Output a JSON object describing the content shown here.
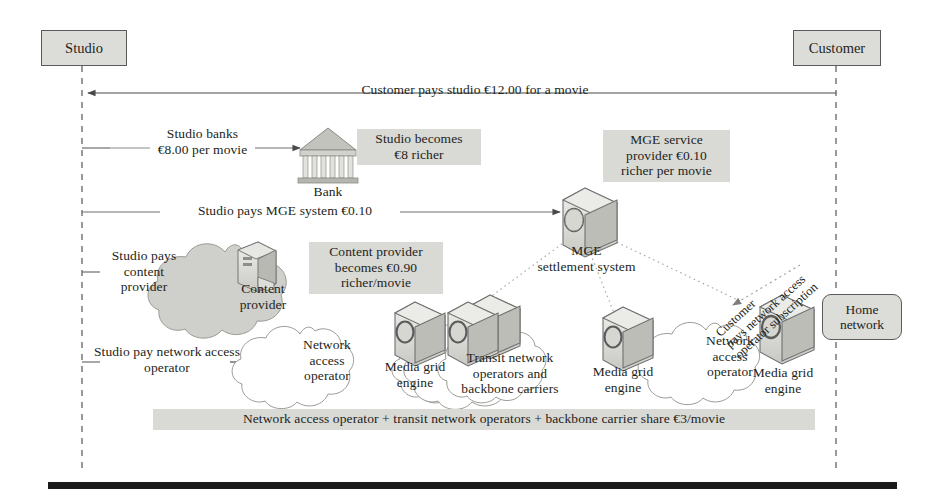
{
  "figure": {
    "type": "flow-diagram",
    "title_visible": false
  },
  "endpoints": {
    "studio": "Studio",
    "customer": "Customer",
    "home_network": "Home\nnetwork"
  },
  "flows": [
    {
      "id": "customer-pays-studio",
      "label": "Customer pays studio €12.00 for a movie",
      "direction": "customer-to-studio",
      "amount": "€12.00"
    },
    {
      "id": "studio-banks",
      "label": "Studio banks\n€8.00 per movie",
      "direction": "studio-to-bank",
      "amount": "€8.00"
    },
    {
      "id": "studio-pays-mge",
      "label": "Studio pays MGE system €0.10",
      "direction": "studio-to-mge",
      "amount": "€0.10"
    },
    {
      "id": "studio-pays-content-provider",
      "label": "Studio pays\ncontent\nprovider",
      "direction": "studio-to-content-provider"
    },
    {
      "id": "studio-pay-network-access-operator",
      "label": "Studio pay network access\noperator",
      "direction": "studio-to-network-access-operator"
    },
    {
      "id": "customer-pays-nao-subscription",
      "label": "Customer\npays network access\noperator subscription",
      "direction": "customer-to-network-access-operator",
      "rotated": true
    }
  ],
  "callouts": [
    {
      "id": "studio-becomes-richer",
      "text": "Studio becomes\n€8 richer",
      "amount": "€8"
    },
    {
      "id": "mge-service-provider-richer",
      "text": "MGE service\nprovider €0.10\nricher per movie",
      "amount": "€0.10"
    },
    {
      "id": "content-provider-richer",
      "text": "Content provider\nbecomes €0.90\nricher/movie",
      "amount": "€0.90"
    },
    {
      "id": "network-share",
      "text": "Network access operator + transit network operators + backbone carrier share €3/movie",
      "amount": "€3/movie"
    }
  ],
  "nodes": [
    {
      "id": "bank",
      "label": "Bank",
      "kind": "building"
    },
    {
      "id": "mge-settlement-system",
      "label": "MGE\nsettlement system",
      "kind": "device"
    },
    {
      "id": "content-provider",
      "label": "Content\nprovider",
      "kind": "cloud-shaded"
    },
    {
      "id": "network-access-operator-left",
      "label": "Network\naccess\noperator",
      "kind": "cloud"
    },
    {
      "id": "transit-network",
      "label": "Transit network\noperators and\nbackbone carriers",
      "kind": "cloud-stack"
    },
    {
      "id": "network-access-operator-right",
      "label": "Network\naccess\noperator",
      "kind": "cloud"
    },
    {
      "id": "media-grid-engine-1",
      "label": "Media grid\nengine",
      "kind": "device"
    },
    {
      "id": "media-grid-engine-2",
      "label": "Media grid\nengine",
      "kind": "device"
    },
    {
      "id": "media-grid-engine-3",
      "label": "Media grid\nengine",
      "kind": "device"
    }
  ],
  "colors": {
    "shade": "#d9d9d6",
    "box_fill": "#dcdcd9",
    "stroke": "#5b5b5b",
    "text": "#231f20",
    "cloud_shaded": "#cfcfcb",
    "rule": "#1a1a1a"
  }
}
